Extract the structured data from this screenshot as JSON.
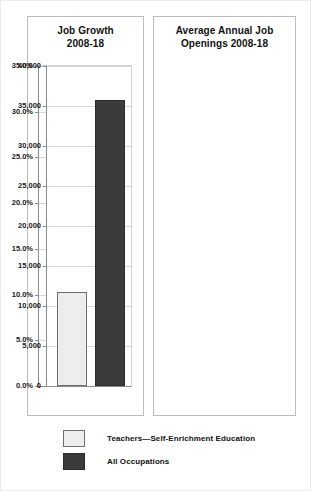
{
  "legend": {
    "items": [
      {
        "label": "Teachers—Self-Enrichment Education",
        "swatch": "light",
        "color": "#ededed"
      },
      {
        "label": "All Occupations",
        "swatch": "dark",
        "color": "#3b3b3b"
      }
    ]
  },
  "chart_data": [
    {
      "type": "bar",
      "id": "job-growth",
      "title": "Job Growth 2008-18",
      "title_line1": "Job Growth",
      "title_line2": "2008-18",
      "xlabel": "",
      "ylabel": "",
      "ylim": [
        0,
        35
      ],
      "yticks": [
        0,
        5,
        10,
        15,
        20,
        25,
        30,
        35
      ],
      "ytick_labels": [
        "0.0%",
        "5.0%",
        "10.0%",
        "15.0%",
        "20.0%",
        "25.0%",
        "30.0%",
        "35.0%"
      ],
      "grid": true,
      "legend_position": "below-figure",
      "categories": [
        "Teachers—Self-Enrichment Education",
        "All Occupations"
      ],
      "values": [
        32.0,
        10.4
      ],
      "value_labels": [
        "32.0%",
        "10.4%"
      ],
      "bar_colors": [
        "#ededed",
        "#3b3b3b"
      ]
    },
    {
      "type": "bar",
      "id": "annual-openings",
      "title": "Average Annual Job Openings 2008-18",
      "title_line1": "Average Annual Job",
      "title_line2": "Openings 2008-18",
      "xlabel": "",
      "ylabel": "",
      "ylim": [
        0,
        40000
      ],
      "yticks": [
        0,
        5000,
        10000,
        15000,
        20000,
        25000,
        30000,
        35000,
        40000
      ],
      "ytick_labels": [
        "0",
        "5,000",
        "10,000",
        "15,000",
        "20,000",
        "25,000",
        "30,000",
        "35,000",
        "40,000"
      ],
      "grid": true,
      "legend_position": "below-figure",
      "categories": [
        "Teachers—Self-Enrichment Education",
        "All Occupations"
      ],
      "values": [
        11800,
        35700
      ],
      "value_labels": [
        "11,800",
        "35,700"
      ],
      "bar_colors": [
        "#ededed",
        "#3b3b3b"
      ]
    }
  ]
}
